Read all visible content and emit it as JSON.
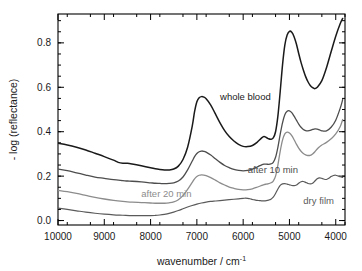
{
  "chart_data": {
    "type": "line",
    "title": "",
    "xlabel": "wavenumber  / cm",
    "xlabel_sup": "-1",
    "ylabel": "- log (reflectance)",
    "xlim": [
      10000,
      3800
    ],
    "ylim": [
      -0.02,
      0.93
    ],
    "x_reversed": true,
    "grid": false,
    "legend_position": "inline-annotations",
    "xticks": [
      10000,
      9000,
      8000,
      7000,
      6000,
      5000,
      4000
    ],
    "xtick_labels": [
      "10000",
      "9000",
      "8000",
      "7000",
      "6000",
      "5000",
      "4000"
    ],
    "xminor_step": 500,
    "yticks": [
      0.0,
      0.2,
      0.4,
      0.6,
      0.8
    ],
    "ytick_labels": [
      "0.0",
      "0.2",
      "0.4",
      "0.6",
      "0.8"
    ],
    "yminor_step": 0.05,
    "series": [
      {
        "name": "whole blood",
        "color": "#1a1a1a",
        "width": 1.5,
        "label_x": 6500,
        "label_y": 0.545,
        "x": [
          10000,
          9800,
          9600,
          9400,
          9200,
          9000,
          8800,
          8700,
          8600,
          8500,
          8400,
          8200,
          8000,
          7900,
          7800,
          7700,
          7600,
          7500,
          7400,
          7300,
          7200,
          7100,
          7050,
          7000,
          6950,
          6900,
          6850,
          6800,
          6700,
          6600,
          6500,
          6400,
          6300,
          6200,
          6100,
          6000,
          5900,
          5800,
          5700,
          5600,
          5550,
          5500,
          5450,
          5400,
          5350,
          5300,
          5250,
          5200,
          5150,
          5100,
          5050,
          5000,
          4950,
          4900,
          4850,
          4800,
          4750,
          4700,
          4650,
          4600,
          4550,
          4500,
          4450,
          4400,
          4300,
          4200,
          4100,
          4000,
          3900,
          3850
        ],
        "y": [
          0.348,
          0.34,
          0.33,
          0.318,
          0.303,
          0.288,
          0.272,
          0.262,
          0.258,
          0.258,
          0.255,
          0.247,
          0.238,
          0.233,
          0.23,
          0.228,
          0.228,
          0.232,
          0.245,
          0.275,
          0.33,
          0.425,
          0.49,
          0.535,
          0.553,
          0.558,
          0.556,
          0.548,
          0.52,
          0.48,
          0.44,
          0.405,
          0.378,
          0.358,
          0.343,
          0.334,
          0.333,
          0.338,
          0.352,
          0.372,
          0.378,
          0.374,
          0.368,
          0.366,
          0.372,
          0.4,
          0.47,
          0.58,
          0.7,
          0.79,
          0.835,
          0.852,
          0.848,
          0.828,
          0.795,
          0.752,
          0.712,
          0.678,
          0.648,
          0.625,
          0.608,
          0.598,
          0.594,
          0.6,
          0.63,
          0.688,
          0.76,
          0.83,
          0.888,
          0.91
        ]
      },
      {
        "name": "after 10 min",
        "color": "#4d4d4d",
        "width": 1.3,
        "label_x": 5900,
        "label_y": 0.215,
        "x": [
          10000,
          9800,
          9600,
          9400,
          9200,
          9000,
          8800,
          8600,
          8500,
          8400,
          8200,
          8000,
          7900,
          7800,
          7700,
          7600,
          7500,
          7400,
          7300,
          7200,
          7100,
          7050,
          7000,
          6950,
          6900,
          6850,
          6800,
          6700,
          6600,
          6500,
          6400,
          6300,
          6200,
          6100,
          6000,
          5900,
          5800,
          5700,
          5600,
          5550,
          5500,
          5450,
          5400,
          5350,
          5300,
          5250,
          5200,
          5150,
          5100,
          5050,
          5000,
          4950,
          4900,
          4850,
          4800,
          4750,
          4700,
          4650,
          4600,
          4550,
          4500,
          4450,
          4400,
          4350,
          4300,
          4200,
          4100,
          4000,
          3900,
          3850
        ],
        "y": [
          0.232,
          0.225,
          0.215,
          0.205,
          0.196,
          0.19,
          0.184,
          0.18,
          0.178,
          0.177,
          0.174,
          0.17,
          0.168,
          0.167,
          0.166,
          0.167,
          0.17,
          0.178,
          0.196,
          0.228,
          0.268,
          0.288,
          0.302,
          0.31,
          0.313,
          0.312,
          0.308,
          0.295,
          0.278,
          0.262,
          0.248,
          0.238,
          0.23,
          0.226,
          0.224,
          0.226,
          0.232,
          0.241,
          0.251,
          0.254,
          0.254,
          0.253,
          0.255,
          0.262,
          0.285,
          0.33,
          0.388,
          0.44,
          0.476,
          0.492,
          0.494,
          0.486,
          0.47,
          0.452,
          0.434,
          0.42,
          0.41,
          0.405,
          0.404,
          0.406,
          0.41,
          0.413,
          0.412,
          0.408,
          0.404,
          0.404,
          0.42,
          0.452,
          0.508,
          0.545
        ]
      },
      {
        "name": "after 20 min",
        "color": "#8c8c8c",
        "width": 1.3,
        "label_x": 8200,
        "label_y": 0.105,
        "x": [
          10000,
          9800,
          9600,
          9400,
          9200,
          9000,
          8800,
          8600,
          8500,
          8400,
          8200,
          8000,
          7900,
          7800,
          7700,
          7600,
          7500,
          7400,
          7300,
          7200,
          7100,
          7050,
          7000,
          6950,
          6900,
          6850,
          6800,
          6700,
          6600,
          6500,
          6400,
          6300,
          6200,
          6100,
          6000,
          5900,
          5800,
          5700,
          5600,
          5550,
          5500,
          5450,
          5400,
          5350,
          5300,
          5250,
          5200,
          5150,
          5100,
          5050,
          5000,
          4950,
          4900,
          4850,
          4800,
          4750,
          4700,
          4650,
          4600,
          4550,
          4500,
          4450,
          4400,
          4350,
          4300,
          4200,
          4100,
          4000,
          3900,
          3850
        ],
        "y": [
          0.136,
          0.13,
          0.122,
          0.113,
          0.104,
          0.097,
          0.091,
          0.086,
          0.084,
          0.083,
          0.081,
          0.079,
          0.078,
          0.078,
          0.078,
          0.08,
          0.084,
          0.094,
          0.112,
          0.14,
          0.172,
          0.188,
          0.198,
          0.204,
          0.206,
          0.205,
          0.202,
          0.193,
          0.182,
          0.17,
          0.16,
          0.151,
          0.145,
          0.14,
          0.138,
          0.139,
          0.143,
          0.15,
          0.158,
          0.162,
          0.164,
          0.166,
          0.17,
          0.178,
          0.2,
          0.25,
          0.312,
          0.362,
          0.39,
          0.398,
          0.394,
          0.382,
          0.364,
          0.344,
          0.326,
          0.312,
          0.302,
          0.296,
          0.293,
          0.294,
          0.3,
          0.31,
          0.322,
          0.332,
          0.34,
          0.352,
          0.368,
          0.39,
          0.425,
          0.455
        ]
      },
      {
        "name": "dry film",
        "color": "#5a5a5a",
        "width": 1.2,
        "label_x": 4700,
        "label_y": 0.075,
        "x": [
          10000,
          9800,
          9600,
          9400,
          9200,
          9000,
          8800,
          8600,
          8400,
          8200,
          8000,
          7900,
          7800,
          7700,
          7600,
          7500,
          7400,
          7300,
          7200,
          7100,
          7000,
          6900,
          6800,
          6700,
          6600,
          6500,
          6400,
          6300,
          6200,
          6100,
          6000,
          5950,
          5900,
          5850,
          5800,
          5750,
          5700,
          5650,
          5600,
          5550,
          5500,
          5450,
          5400,
          5350,
          5300,
          5250,
          5200,
          5150,
          5100,
          5050,
          5000,
          4950,
          4900,
          4850,
          4800,
          4750,
          4700,
          4650,
          4600,
          4550,
          4500,
          4450,
          4400,
          4350,
          4300,
          4250,
          4200,
          4150,
          4100,
          4050,
          4000,
          3950,
          3900,
          3850
        ],
        "y": [
          0.056,
          0.05,
          0.044,
          0.038,
          0.033,
          0.029,
          0.026,
          0.024,
          0.022,
          0.022,
          0.022,
          0.023,
          0.025,
          0.028,
          0.032,
          0.038,
          0.045,
          0.053,
          0.061,
          0.068,
          0.074,
          0.079,
          0.083,
          0.086,
          0.088,
          0.09,
          0.092,
          0.094,
          0.096,
          0.098,
          0.1,
          0.101,
          0.1,
          0.098,
          0.095,
          0.093,
          0.091,
          0.09,
          0.089,
          0.089,
          0.09,
          0.092,
          0.096,
          0.105,
          0.122,
          0.142,
          0.158,
          0.165,
          0.166,
          0.164,
          0.161,
          0.158,
          0.157,
          0.16,
          0.168,
          0.175,
          0.176,
          0.172,
          0.167,
          0.165,
          0.168,
          0.178,
          0.188,
          0.192,
          0.19,
          0.186,
          0.185,
          0.19,
          0.198,
          0.203,
          0.204,
          0.201,
          0.197,
          0.194
        ]
      }
    ]
  },
  "axes": {
    "ylabel": "- log (reflectance)",
    "xlabel_main": "wavenumber  / cm",
    "xlabel_exp": "-1"
  }
}
